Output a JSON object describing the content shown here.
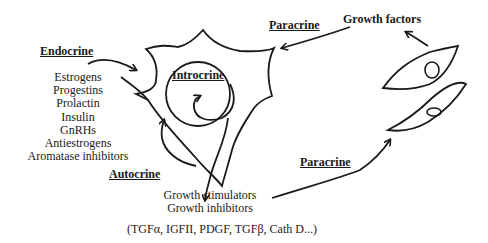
{
  "diagram": {
    "labels": {
      "endocrine": "Endocrine",
      "introcrine": "Introcrine",
      "autocrine": "Autocrine",
      "paracrine_top": "Paracrine",
      "paracrine_bottom": "Paracrine",
      "growth_factors": "Growth factors"
    },
    "endocrine_factors": [
      "Estrogens",
      "Progestins",
      "Prolactin",
      "Insulin",
      "GnRHs",
      "Antiestrogens",
      "Aromatase inhibitors"
    ],
    "secreted": {
      "line1": "Growth stimulators",
      "line2": "Growth inhibitors",
      "examples": "(TGFα, IGFII, PDGF, TGFβ, Cath D...)"
    },
    "colors": {
      "ink": "#1a1a1a",
      "background": "#ffffff"
    }
  }
}
